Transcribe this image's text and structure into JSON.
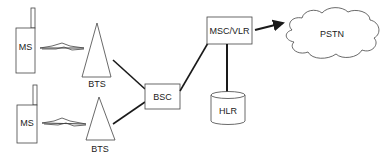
{
  "diagram": {
    "nodes": {
      "ms_top": {
        "label": "MS"
      },
      "ms_bottom": {
        "label": "MS"
      },
      "bts_top": {
        "label": "BTS"
      },
      "bts_bottom": {
        "label": "BTS"
      },
      "bsc": {
        "label": "BSC"
      },
      "msc_vlr": {
        "label": "MSC/VLR"
      },
      "hlr": {
        "label": "HLR"
      },
      "pstn": {
        "label": "PSTN"
      }
    },
    "edges": [
      {
        "from": "MS",
        "to": "BTS",
        "type": "radio-link"
      },
      {
        "from": "MS",
        "to": "BTS",
        "type": "radio-link"
      },
      {
        "from": "BTS",
        "to": "BSC",
        "type": "line"
      },
      {
        "from": "BTS",
        "to": "BSC",
        "type": "line"
      },
      {
        "from": "BSC",
        "to": "MSC/VLR",
        "type": "line"
      },
      {
        "from": "MSC/VLR",
        "to": "HLR",
        "type": "line"
      },
      {
        "from": "MSC/VLR",
        "to": "PSTN",
        "type": "arrow"
      }
    ],
    "colors": {
      "stroke": "#333333",
      "line": "#1a1a1a",
      "background": "#ffffff"
    }
  }
}
